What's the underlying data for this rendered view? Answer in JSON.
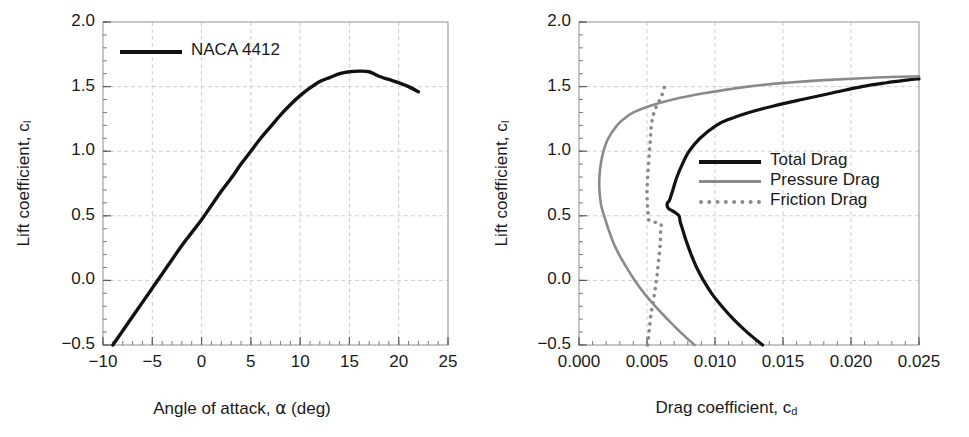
{
  "chart_data": [
    {
      "type": "line",
      "id": "lift-curve",
      "title": "",
      "xlabel": "Angle of attack, α (deg)",
      "xlabel_parts": {
        "text": "Angle of attack, ",
        "symbol": "α",
        "unit": " (deg)"
      },
      "ylabel": "Lift coefficient, c_l",
      "ylabel_parts": {
        "text": "Lift coefficient, c",
        "sub": "l"
      },
      "xlim": [
        -10,
        25
      ],
      "ylim": [
        -0.5,
        2.0
      ],
      "xticks": [
        "−10",
        "−5",
        "0",
        "5",
        "10",
        "15",
        "20",
        "25"
      ],
      "xtick_values": [
        -10,
        -5,
        0,
        5,
        10,
        15,
        20,
        25
      ],
      "yticks": [
        "−0.5",
        "0.0",
        "0.5",
        "1.0",
        "1.5",
        "2.0"
      ],
      "ytick_values": [
        -0.5,
        0.0,
        0.5,
        1.0,
        1.5,
        2.0
      ],
      "x_minor_step": 1,
      "y_minor_step": 0.1,
      "grid": true,
      "legend_position": "top-left",
      "series": [
        {
          "name": "NACA 4412",
          "color": "#111111",
          "style": "solid",
          "x": [
            -9.0,
            -8.0,
            -7.0,
            -6.0,
            -5.0,
            -4.0,
            -3.0,
            -2.0,
            -1.0,
            0.0,
            1.0,
            2.0,
            3.0,
            4.0,
            5.0,
            6.0,
            7.0,
            8.0,
            9.0,
            10.0,
            11.0,
            12.0,
            13.0,
            14.0,
            15.0,
            16.0,
            17.0,
            18.0,
            19.0,
            20.0,
            21.0,
            22.0
          ],
          "y": [
            -0.5,
            -0.39,
            -0.28,
            -0.17,
            -0.06,
            0.05,
            0.16,
            0.27,
            0.37,
            0.47,
            0.58,
            0.69,
            0.79,
            0.9,
            1.0,
            1.1,
            1.19,
            1.28,
            1.36,
            1.43,
            1.49,
            1.54,
            1.57,
            1.6,
            1.615,
            1.62,
            1.615,
            1.58,
            1.555,
            1.53,
            1.5,
            1.46
          ]
        }
      ]
    },
    {
      "type": "line",
      "id": "drag-polar",
      "title": "",
      "xlabel": "Drag coefficient, c_d",
      "xlabel_parts": {
        "text": "Drag coefficient, c",
        "sub": "d"
      },
      "ylabel": "Lift coefficient, c_l",
      "ylabel_parts": {
        "text": "Lift coefficient, c",
        "sub": "l"
      },
      "xlim": [
        0.0,
        0.025
      ],
      "ylim": [
        -0.5,
        2.0
      ],
      "xticks": [
        "0.000",
        "0.005",
        "0.010",
        "0.015",
        "0.020",
        "0.025"
      ],
      "xtick_values": [
        0.0,
        0.005,
        0.01,
        0.015,
        0.02,
        0.025
      ],
      "yticks": [
        "−0.5",
        "0.0",
        "0.5",
        "1.0",
        "1.5",
        "2.0"
      ],
      "ytick_values": [
        -0.5,
        0.0,
        0.5,
        1.0,
        1.5,
        2.0
      ],
      "x_minor_step": 0.001,
      "y_minor_step": 0.1,
      "grid": true,
      "legend_position": "middle-right",
      "axes_note": "x = drag coefficient, y = lift coefficient",
      "series": [
        {
          "name": "Total Drag",
          "color": "#111111",
          "style": "solid",
          "y": [
            -0.5,
            -0.4,
            -0.3,
            -0.2,
            -0.1,
            0.0,
            0.1,
            0.2,
            0.3,
            0.4,
            0.45,
            0.5,
            0.53,
            0.55,
            0.57,
            0.6,
            0.62,
            0.7,
            0.8,
            0.9,
            1.0,
            1.1,
            1.2,
            1.25,
            1.3,
            1.35,
            1.4,
            1.45,
            1.5,
            1.53,
            1.55,
            1.56
          ],
          "x": [
            0.0135,
            0.01235,
            0.01135,
            0.0105,
            0.00975,
            0.00915,
            0.00865,
            0.00825,
            0.0079,
            0.0076,
            0.00745,
            0.00735,
            0.007,
            0.00665,
            0.0065,
            0.0065,
            0.00665,
            0.0069,
            0.0072,
            0.0076,
            0.0081,
            0.0089,
            0.0101,
            0.0111,
            0.0125,
            0.0143,
            0.0164,
            0.0186,
            0.0208,
            0.0226,
            0.0241,
            0.025
          ]
        },
        {
          "name": "Pressure Drag",
          "color": "#8a8a8a",
          "style": "solid",
          "y": [
            -0.5,
            -0.4,
            -0.3,
            -0.2,
            -0.1,
            0.0,
            0.1,
            0.2,
            0.3,
            0.4,
            0.45,
            0.5,
            0.55,
            0.6,
            0.7,
            0.8,
            0.9,
            1.0,
            1.1,
            1.2,
            1.25,
            1.3,
            1.35,
            1.4,
            1.45,
            1.5,
            1.53,
            1.55,
            1.57,
            1.58
          ],
          "x": [
            0.0085,
            0.00745,
            0.0065,
            0.0056,
            0.0048,
            0.0041,
            0.0035,
            0.00295,
            0.0025,
            0.00215,
            0.002,
            0.00185,
            0.0017,
            0.0016,
            0.0015,
            0.0015,
            0.0016,
            0.0018,
            0.00215,
            0.0028,
            0.0033,
            0.004,
            0.0052,
            0.0069,
            0.0093,
            0.0124,
            0.0153,
            0.018,
            0.0219,
            0.025
          ]
        },
        {
          "name": "Friction Drag",
          "color": "#8a8a8a",
          "style": "dotted",
          "y": [
            -0.5,
            -0.45,
            -0.4,
            -0.35,
            -0.3,
            -0.25,
            -0.2,
            -0.15,
            -0.1,
            -0.05,
            0.0,
            0.05,
            0.1,
            0.15,
            0.2,
            0.25,
            0.3,
            0.35,
            0.4,
            0.44,
            0.46,
            0.5,
            0.52,
            0.55,
            0.6,
            0.65,
            0.7,
            0.75,
            0.8,
            0.85,
            0.9,
            0.95,
            1.0,
            1.05,
            1.1,
            1.15,
            1.2,
            1.25,
            1.3,
            1.35,
            1.4,
            1.45,
            1.5,
            1.53
          ],
          "x": [
            0.00505,
            0.0051,
            0.00515,
            0.0052,
            0.00525,
            0.0053,
            0.0054,
            0.00548,
            0.00555,
            0.00562,
            0.00568,
            0.00575,
            0.0058,
            0.00585,
            0.0059,
            0.00595,
            0.00598,
            0.006,
            0.006,
            0.00598,
            0.0052,
            0.00512,
            0.00508,
            0.00505,
            0.00502,
            0.005,
            0.005,
            0.00502,
            0.00505,
            0.00508,
            0.00512,
            0.00515,
            0.00518,
            0.00522,
            0.00525,
            0.00528,
            0.00532,
            0.0054,
            0.00552,
            0.0057,
            0.00595,
            0.00615,
            0.00628,
            0.00632
          ]
        }
      ]
    }
  ],
  "left_panel": {
    "legend": [
      {
        "label": "NACA 4412",
        "key": "solid-black"
      }
    ]
  },
  "right_panel": {
    "legend": [
      {
        "label": "Total Drag",
        "key": "solid-black"
      },
      {
        "label": "Pressure Drag",
        "key": "solid-gray"
      },
      {
        "label": "Friction Drag",
        "key": "dotted-gray"
      }
    ]
  }
}
